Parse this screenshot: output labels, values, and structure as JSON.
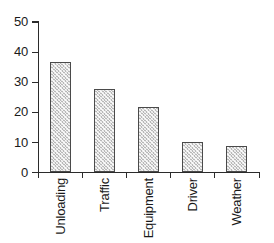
{
  "chart_data": {
    "type": "bar",
    "title": "",
    "subtitle": "",
    "xlabel": "",
    "ylabel": "",
    "categories": [
      "Unloading",
      "Traffic",
      "Equipment",
      "Driver",
      "Weather"
    ],
    "values": [
      36.5,
      27.5,
      21.5,
      10,
      8.5
    ],
    "ylim": [
      0,
      50
    ],
    "yticks": [
      0,
      10,
      20,
      30,
      40,
      50
    ],
    "ytick_labels": [
      "0",
      "10",
      "20",
      "30",
      "40",
      "50"
    ],
    "grid": false,
    "legend": null,
    "bar_fill_color": "#b9b9b9",
    "bar_edge_color": "#4a4a4a",
    "axis_color": "#2b2b2b",
    "background_color": "#ffffff"
  }
}
